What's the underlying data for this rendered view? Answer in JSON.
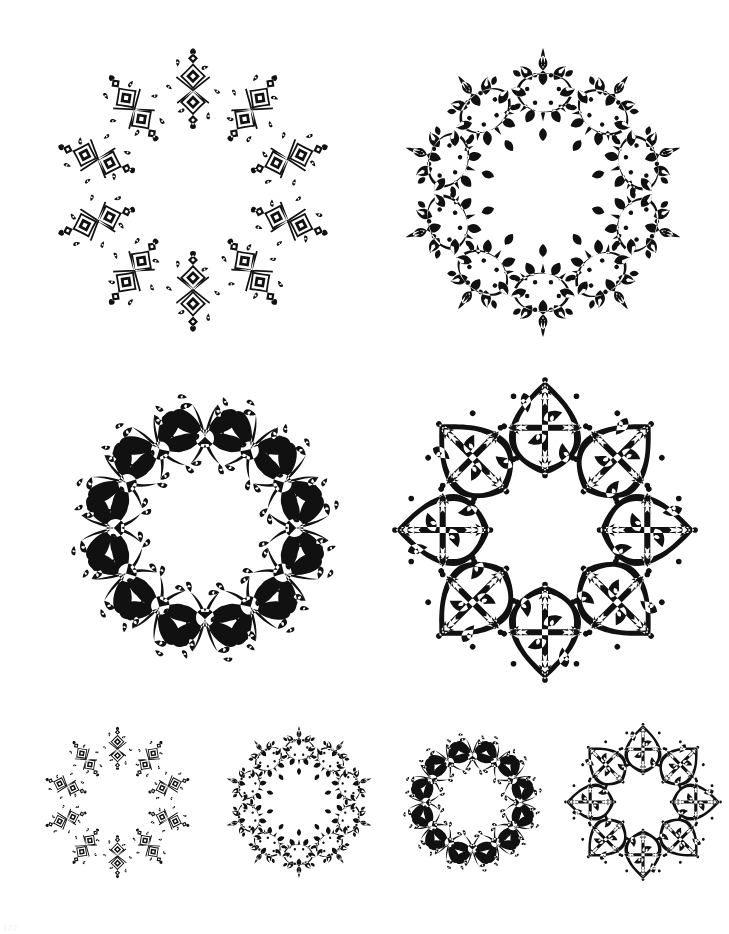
{
  "page": {
    "background_color": "#ffffff",
    "ink_color": "#111111",
    "page_number": "122",
    "width": 729,
    "height": 934
  },
  "ornaments": [
    {
      "id": "ornament-1",
      "name": "diamond-quatrefoil-wreath-large",
      "style": "geometric diamond and scroll quatrefoil",
      "motif": "diamond-scroll",
      "repeats": 10,
      "size": "large",
      "row": 1,
      "column": 1,
      "x": 48,
      "y": 40,
      "width": 290,
      "height": 300,
      "weight": "light",
      "inner_hole_ratio": 0.45
    },
    {
      "id": "ornament-2",
      "name": "dense-arabesque-star-wreath-large",
      "style": "dense foliate arabesque star",
      "motif": "foliate-arabesque",
      "repeats": 10,
      "size": "large",
      "row": 1,
      "column": 2,
      "x": 393,
      "y": 40,
      "width": 300,
      "height": 305,
      "weight": "dense",
      "inner_hole_ratio": 0.42
    },
    {
      "id": "ornament-3",
      "name": "baroque-acanthus-wreath-large",
      "style": "heavy baroque acanthus butterfly",
      "motif": "acanthus-butterfly",
      "repeats": 12,
      "size": "large",
      "row": 2,
      "column": 1,
      "x": 55,
      "y": 378,
      "width": 300,
      "height": 300,
      "weight": "heavy",
      "inner_hole_ratio": 0.5
    },
    {
      "id": "ornament-4",
      "name": "moorish-arabesque-star-wreath-large",
      "style": "bold moorish arabesque star",
      "motif": "moorish-scroll",
      "repeats": 8,
      "size": "large",
      "row": 2,
      "column": 2,
      "x": 390,
      "y": 375,
      "width": 310,
      "height": 310,
      "weight": "bold",
      "inner_hole_ratio": 0.46
    },
    {
      "id": "ornament-5",
      "name": "diamond-quatrefoil-wreath-small",
      "style": "geometric diamond and scroll quatrefoil",
      "motif": "diamond-scroll",
      "repeats": 10,
      "size": "small",
      "row": 3,
      "column": 1,
      "x": 40,
      "y": 725,
      "width": 155,
      "height": 155,
      "weight": "light",
      "inner_hole_ratio": 0.45
    },
    {
      "id": "ornament-6",
      "name": "dense-arabesque-star-wreath-small",
      "style": "dense foliate arabesque star",
      "motif": "foliate-arabesque",
      "repeats": 10,
      "size": "small",
      "row": 3,
      "column": 2,
      "x": 220,
      "y": 723,
      "width": 158,
      "height": 158,
      "weight": "dense",
      "inner_hole_ratio": 0.42
    },
    {
      "id": "ornament-7",
      "name": "baroque-acanthus-wreath-small",
      "style": "heavy baroque acanthus butterfly",
      "motif": "acanthus-butterfly",
      "repeats": 12,
      "size": "small",
      "row": 3,
      "column": 3,
      "x": 395,
      "y": 725,
      "width": 155,
      "height": 155,
      "weight": "heavy",
      "inner_hole_ratio": 0.5
    },
    {
      "id": "ornament-8",
      "name": "moorish-arabesque-star-wreath-small",
      "style": "bold moorish arabesque star",
      "motif": "moorish-scroll",
      "repeats": 8,
      "size": "small",
      "row": 3,
      "column": 4,
      "x": 563,
      "y": 722,
      "width": 160,
      "height": 160,
      "weight": "bold",
      "inner_hole_ratio": 0.46
    }
  ]
}
